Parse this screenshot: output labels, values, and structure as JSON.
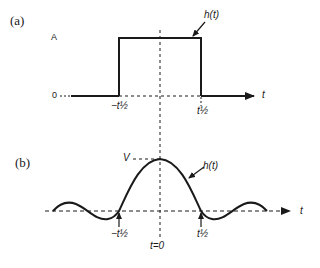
{
  "panels": {
    "a": {
      "label": "(a)",
      "amplitude_label": "A",
      "zero_label": "0",
      "curve_label": "h(t)",
      "axis_label": "t",
      "left_edge_label": "−t½",
      "right_edge_label": "t½"
    },
    "b": {
      "label": "(b)",
      "peak_label": "V",
      "curve_label": "h(t)",
      "axis_label": "t",
      "left_zero_label": "−t½",
      "right_zero_label": "t½",
      "center_label": "t=0"
    }
  },
  "colors": {
    "ink": "#1a1a1a",
    "background": "#ffffff"
  }
}
